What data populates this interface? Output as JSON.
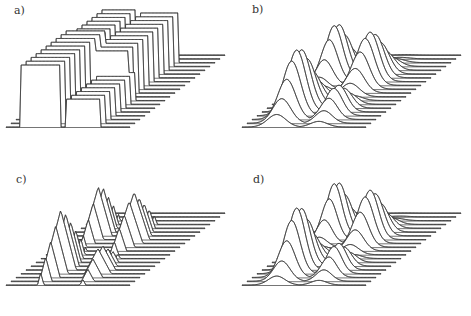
{
  "figure": {
    "panels": [
      {
        "id": "a",
        "label": "a)",
        "style": "step",
        "left": 0,
        "top": 0,
        "label_x": 14,
        "label_y": 4
      },
      {
        "id": "b",
        "label": "b)",
        "style": "smooth",
        "left": 236,
        "top": 0,
        "label_x": 16,
        "label_y": 3
      },
      {
        "id": "c",
        "label": "c)",
        "style": "linear",
        "left": 0,
        "top": 158,
        "label_x": 16,
        "label_y": 15
      },
      {
        "id": "d",
        "label": "d)",
        "style": "smooth",
        "left": 236,
        "top": 158,
        "label_x": 17,
        "label_y": 15
      }
    ]
  },
  "chart_data": [
    {
      "type": "surface",
      "title": "a)",
      "xlabel": "",
      "ylabel": "",
      "zlabel": "",
      "grid": false,
      "rows": 20,
      "interpolation": "piecewise-constant",
      "peaks": [
        {
          "u": 0.28,
          "v": 0.22,
          "width": 0.16,
          "depth": 0.28,
          "height": 1.0
        },
        {
          "u": 0.22,
          "v": 0.7,
          "width": 0.14,
          "depth": 0.22,
          "height": 0.85
        },
        {
          "u": 0.55,
          "v": 0.62,
          "width": 0.16,
          "depth": 0.28,
          "height": 0.8
        },
        {
          "u": 0.62,
          "v": 0.18,
          "width": 0.14,
          "depth": 0.22,
          "height": 0.45
        }
      ]
    },
    {
      "type": "surface",
      "title": "b)",
      "xlabel": "",
      "ylabel": "",
      "zlabel": "",
      "grid": false,
      "rows": 20,
      "interpolation": "smooth",
      "peaks": [
        {
          "u": 0.28,
          "v": 0.22,
          "width": 0.13,
          "depth": 0.22,
          "height": 1.0
        },
        {
          "u": 0.22,
          "v": 0.7,
          "width": 0.12,
          "depth": 0.18,
          "height": 0.85
        },
        {
          "u": 0.55,
          "v": 0.62,
          "width": 0.13,
          "depth": 0.22,
          "height": 0.8
        },
        {
          "u": 0.62,
          "v": 0.18,
          "width": 0.12,
          "depth": 0.18,
          "height": 0.45
        }
      ]
    },
    {
      "type": "surface",
      "title": "c)",
      "xlabel": "",
      "ylabel": "",
      "zlabel": "",
      "grid": false,
      "rows": 20,
      "interpolation": "piecewise-linear",
      "peaks": [
        {
          "u": 0.28,
          "v": 0.22,
          "width": 0.13,
          "depth": 0.22,
          "height": 1.0
        },
        {
          "u": 0.22,
          "v": 0.7,
          "width": 0.12,
          "depth": 0.18,
          "height": 0.85
        },
        {
          "u": 0.55,
          "v": 0.62,
          "width": 0.13,
          "depth": 0.22,
          "height": 0.8
        },
        {
          "u": 0.62,
          "v": 0.18,
          "width": 0.12,
          "depth": 0.18,
          "height": 0.45
        }
      ]
    },
    {
      "type": "surface",
      "title": "d)",
      "xlabel": "",
      "ylabel": "",
      "zlabel": "",
      "grid": false,
      "rows": 20,
      "interpolation": "smooth",
      "peaks": [
        {
          "u": 0.28,
          "v": 0.22,
          "width": 0.12,
          "depth": 0.2,
          "height": 1.0
        },
        {
          "u": 0.22,
          "v": 0.7,
          "width": 0.11,
          "depth": 0.17,
          "height": 0.85
        },
        {
          "u": 0.55,
          "v": 0.62,
          "width": 0.12,
          "depth": 0.2,
          "height": 0.8
        },
        {
          "u": 0.62,
          "v": 0.18,
          "width": 0.11,
          "depth": 0.17,
          "height": 0.45
        }
      ]
    }
  ]
}
